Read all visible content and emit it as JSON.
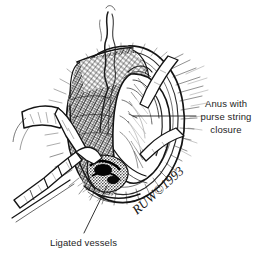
{
  "figure": {
    "kind": "medical-line-illustration",
    "technique": "pen-and-ink stipple and hatching",
    "background_color": "#ffffff",
    "ink_color": "#1a1a1a",
    "text_color": "#1d1d1d",
    "width": 266,
    "height": 265
  },
  "labels": {
    "anus": {
      "name": "anus-with-purse-string-closure",
      "lines": [
        "Anus with",
        "purse string",
        "closure"
      ],
      "align": "center",
      "leader_from": [
        196,
        116
      ],
      "leader_to": [
        133,
        116
      ]
    },
    "ligated": {
      "name": "ligated-vessels",
      "lines": [
        "Ligated vessels"
      ],
      "align": "left",
      "leader_from": [
        84,
        233
      ],
      "leader_to": [
        107,
        186
      ]
    }
  },
  "signature": {
    "text": "RUW©1993",
    "artist_initials": "RUW",
    "year": "1993",
    "rotation_deg": -42,
    "position": [
      137,
      215
    ]
  },
  "elements": {
    "suture_thread": "suture-thread-top",
    "retractor_upper": "surgical-retractor-upper-left",
    "retractor_lower": "surgical-clamp-lower-left",
    "wound_margin": "wound-margin-hatching",
    "tissue_wall": "cross-hatched-tissue-wall",
    "anal_canal": "anal-canal-central",
    "vessel_ties": "ligated-vessel-cluster"
  }
}
